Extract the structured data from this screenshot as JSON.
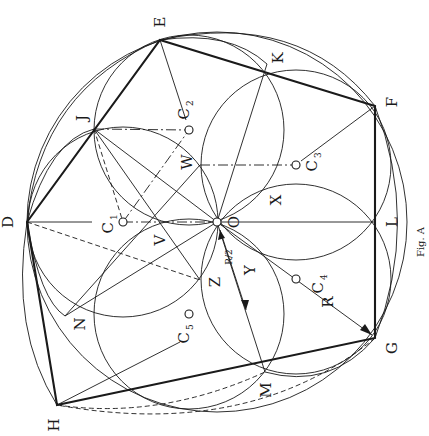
{
  "figure": {
    "caption": "Fig. A",
    "center_label": "O",
    "outer_circle_radius": 190,
    "points": {
      "D": {
        "label": "D"
      },
      "E": {
        "label": "E"
      },
      "F": {
        "label": "F"
      },
      "G": {
        "label": "G"
      },
      "H": {
        "label": "H"
      },
      "J": {
        "label": "J"
      },
      "K": {
        "label": "K"
      },
      "L": {
        "label": "L"
      },
      "M": {
        "label": "M"
      },
      "N": {
        "label": "N"
      }
    },
    "centers": [
      {
        "label": "C",
        "sub": "1"
      },
      {
        "label": "C",
        "sub": "2"
      },
      {
        "label": "C",
        "sub": "3"
      },
      {
        "label": "C",
        "sub": "4"
      },
      {
        "label": "C",
        "sub": "5"
      }
    ],
    "region_labels": [
      "V",
      "W",
      "X",
      "Y",
      "Z"
    ],
    "dimensions": {
      "radius_label": "R",
      "half_radius_label": "R/2"
    }
  }
}
